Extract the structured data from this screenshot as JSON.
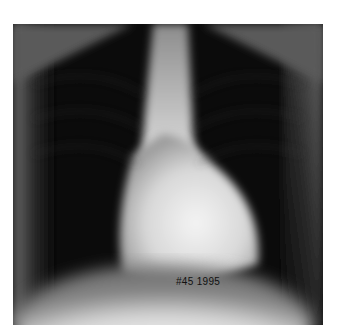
{
  "image": {
    "subject": "chest x-ray, posteroanterior view",
    "annotation_text": "#45 1995",
    "background_color": "#ffffff",
    "film_dark": "#0a0a0a",
    "film_bright": "#f2f2f2"
  }
}
